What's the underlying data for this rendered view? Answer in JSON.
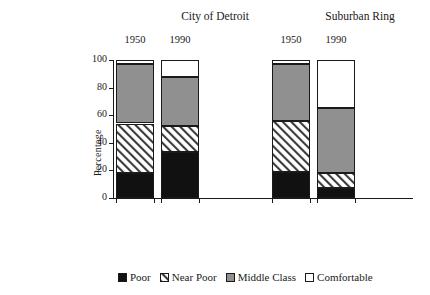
{
  "groups": [
    {
      "title": "City of Detroit"
    },
    {
      "title": "Suburban Ring"
    }
  ],
  "axis": {
    "ylabel": "Percentage",
    "ticks": [
      "100",
      "80",
      "60",
      "40",
      "20",
      "0"
    ]
  },
  "legend": [
    {
      "label": "Poor",
      "key": "poor",
      "color": "#111111"
    },
    {
      "label": "Near Poor",
      "key": "near_poor",
      "color": "#ffffff"
    },
    {
      "label": "Middle Class",
      "key": "middle_class",
      "color": "#909090"
    },
    {
      "label": "Comfortable",
      "key": "comfortable",
      "color": "#ffffff"
    }
  ],
  "table": {
    "rows": [
      {
        "label": "Median Family Income",
        "values": [
          "$25,125",
          "$24,262",
          "$25,795",
          "$52,201"
        ]
      },
      {
        "label": "Population",
        "values": [
          "1,847,000",
          "1,007,000",
          "1,160,000",
          "3,283,000"
        ]
      },
      {
        "label": "Blacks as a Percentage of",
        "values": [
          "",
          "",
          "",
          ""
        ]
      },
      {
        "label": "  Total Population",
        "values": [
          "16%",
          "76%",
          "5%",
          "5%"
        ]
      }
    ]
  },
  "chart_data": {
    "type": "bar",
    "stacked": true,
    "title": "",
    "xlabel": "",
    "ylabel": "Percentage",
    "ylim": [
      0,
      100
    ],
    "yticks": [
      0,
      20,
      40,
      60,
      80,
      100
    ],
    "grid": false,
    "legend_position": "bottom",
    "categories": [
      "1950",
      "1990",
      "1950",
      "1990"
    ],
    "group_labels": [
      "City of Detroit",
      "City of Detroit",
      "Suburban Ring",
      "Suburban Ring"
    ],
    "series": [
      {
        "name": "Poor",
        "values": [
          18,
          33,
          19,
          7
        ]
      },
      {
        "name": "Near Poor",
        "values": [
          36,
          19,
          37,
          11
        ]
      },
      {
        "name": "Middle Class",
        "values": [
          43,
          36,
          41,
          47
        ]
      },
      {
        "name": "Comfortable",
        "values": [
          3,
          12,
          3,
          35
        ]
      }
    ]
  }
}
